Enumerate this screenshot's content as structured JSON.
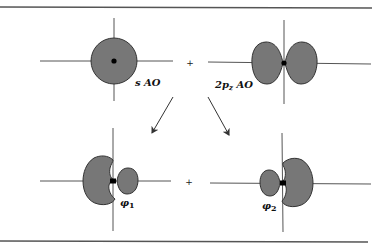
{
  "diagram": {
    "colors": {
      "orbital_fill": "#777777",
      "orbital_stroke": "#333333",
      "line": "#444444",
      "nucleus": "#000000"
    },
    "top_row": {
      "s_orbital": {
        "label_main": "s AO",
        "label": "s AO"
      },
      "operator": "+",
      "p_orbital": {
        "label_prefix": "2p",
        "label_sub": "z",
        "label_suffix": " AO",
        "label": "2pz AO"
      }
    },
    "bottom_row": {
      "hybrid_1": {
        "label_main": "φ",
        "label_sub": "1"
      },
      "operator": "+",
      "hybrid_2": {
        "label_main": "φ",
        "label_sub": "2"
      }
    },
    "arrows": [
      {
        "from": "top",
        "to": "hybrid_1",
        "direction": "down-left"
      },
      {
        "from": "top",
        "to": "hybrid_2",
        "direction": "down-right"
      }
    ]
  }
}
